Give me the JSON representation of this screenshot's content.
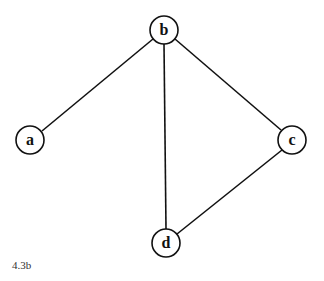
{
  "graph": {
    "nodes": [
      {
        "id": "a",
        "label": "a",
        "x": 30,
        "y": 140
      },
      {
        "id": "b",
        "label": "b",
        "x": 164,
        "y": 30
      },
      {
        "id": "c",
        "label": "c",
        "x": 292,
        "y": 140
      },
      {
        "id": "d",
        "label": "d",
        "x": 166,
        "y": 243
      }
    ],
    "edges": [
      {
        "from": "b",
        "to": "a"
      },
      {
        "from": "b",
        "to": "c"
      },
      {
        "from": "b",
        "to": "d"
      },
      {
        "from": "c",
        "to": "d"
      }
    ]
  },
  "caption": "4.3b"
}
